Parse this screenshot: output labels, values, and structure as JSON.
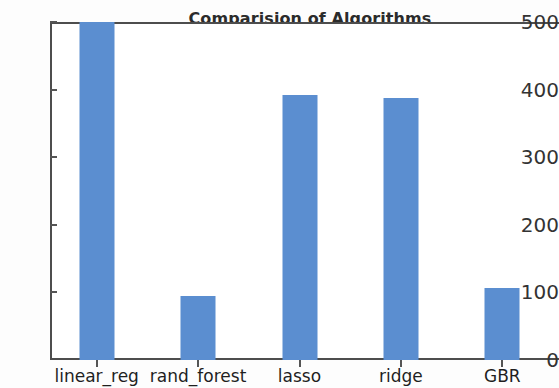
{
  "chart_data": {
    "type": "bar",
    "title": "Comparision of Algorithms",
    "xlabel": "",
    "ylabel": "",
    "categories": [
      "linear_reg",
      "rand_forest",
      "lasso",
      "ridge",
      "GBR"
    ],
    "values": [
      500,
      95,
      392,
      387,
      107
    ],
    "ylim": [
      0,
      500
    ],
    "yticks": [
      0,
      100,
      200,
      300,
      400,
      500
    ],
    "ytick_labels": [
      "0",
      "100",
      "200",
      "300",
      "400",
      "500"
    ],
    "grid": false,
    "legend": false,
    "bar_color": "#5b8ed0",
    "axis_color": "#4d4d4d",
    "background": "#ffffff"
  }
}
